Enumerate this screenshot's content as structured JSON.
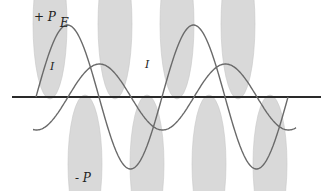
{
  "diagram": {
    "labels": {
      "plus_p": "+ P",
      "minus_p": "- P",
      "e": "E",
      "i_left": "I",
      "i_mid": "I"
    },
    "colors": {
      "axis": "#2a2a2a",
      "curve": "#6a6a6a",
      "lobe_fill": "#d9d9d9",
      "lobe_stroke": "#c8c8c8",
      "text": "#222222"
    },
    "axis": {
      "x1": 12,
      "x2": 321,
      "y": 97
    },
    "voltage_e": {
      "amplitude": 72,
      "period": 126,
      "x_start": 36,
      "x_end": 288,
      "phase_zero_x": 36
    },
    "current_i": {
      "amplitude": 33,
      "period": 126,
      "x_start": 33,
      "x_end": 296,
      "phase_zero_x": 68
    },
    "power_lobes": [
      {
        "cx": 50,
        "sign": "positive",
        "rx": 17,
        "ry": 75
      },
      {
        "cx": 85,
        "sign": "negative",
        "rx": 17,
        "ry": 69
      },
      {
        "cx": 115,
        "sign": "positive",
        "rx": 17,
        "ry": 75
      },
      {
        "cx": 147,
        "sign": "negative",
        "rx": 17,
        "ry": 69
      },
      {
        "cx": 177,
        "sign": "positive",
        "rx": 17,
        "ry": 75
      },
      {
        "cx": 209,
        "sign": "negative",
        "rx": 17,
        "ry": 69
      },
      {
        "cx": 238,
        "sign": "positive",
        "rx": 17,
        "ry": 75
      },
      {
        "cx": 270,
        "sign": "negative",
        "rx": 17,
        "ry": 69
      }
    ]
  }
}
